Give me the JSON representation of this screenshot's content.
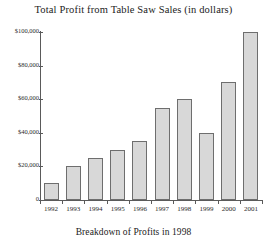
{
  "chart_data": {
    "type": "bar",
    "title": "Total Profit from Table Saw Sales (in dollars)",
    "caption": "Breakdown of Profits in 1998",
    "xlabel": "",
    "ylabel": "",
    "categories": [
      "1992",
      "1993",
      "1994",
      "1995",
      "1996",
      "1997",
      "1998",
      "1999",
      "2000",
      "2001"
    ],
    "values": [
      10000,
      20000,
      25000,
      30000,
      35000,
      55000,
      60000,
      40000,
      70000,
      100000
    ],
    "ylim": [
      0,
      100000
    ],
    "ytick_values": [
      100000,
      80000,
      60000,
      40000,
      20000,
      0
    ],
    "ytick_labels": [
      "$100,000",
      "$80,000",
      "$60,000",
      "$40,000",
      "$20,000",
      "0"
    ],
    "grid": false,
    "legend": null,
    "bar_color": "#d8d8d8",
    "bar_edge_color": "#6e6e6e",
    "axis_color": "#5a5a5a",
    "background": "#ffffff"
  }
}
